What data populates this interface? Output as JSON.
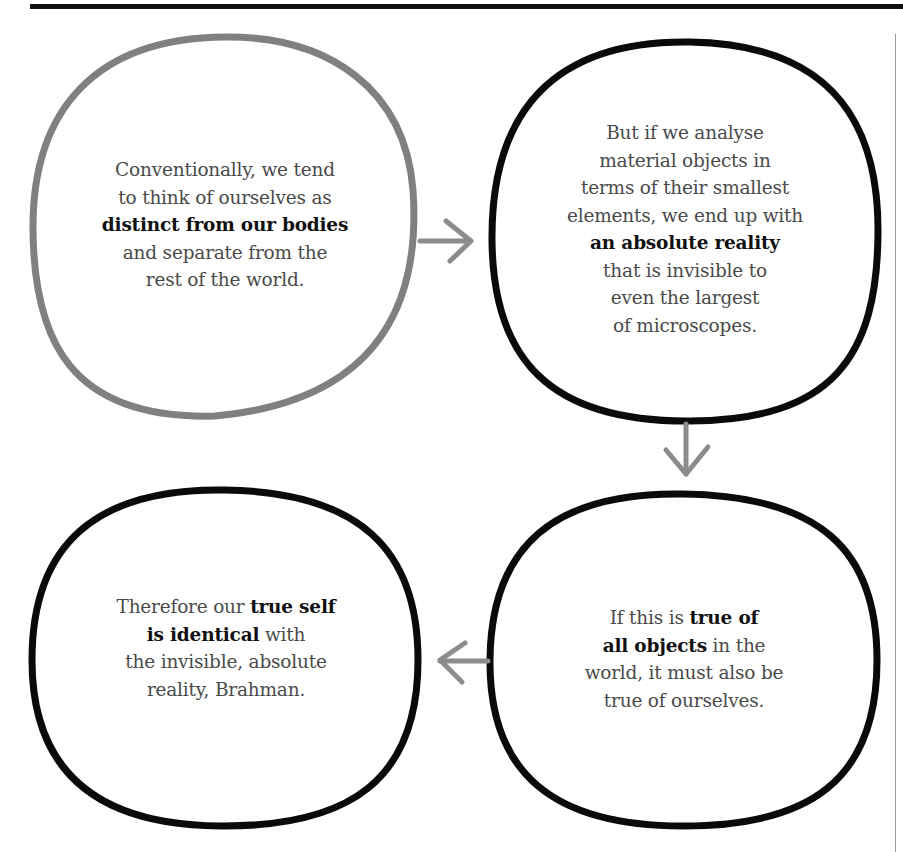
{
  "diagram": {
    "type": "cycle-flow",
    "colors": {
      "first_node_stroke": "#808080",
      "node_stroke": "#0a0a0a",
      "arrow": "#8c8c8c",
      "text": "#4a4a4a",
      "bold_text": "#111111",
      "top_rule": "#111111",
      "side_rule": "#9a9a9a"
    },
    "nodes": [
      {
        "id": "node-1",
        "position": "top-left",
        "lines": [
          {
            "parts": [
              {
                "text": "Conventionally, we tend",
                "bold": false
              }
            ]
          },
          {
            "parts": [
              {
                "text": "to think of ourselves as",
                "bold": false
              }
            ]
          },
          {
            "parts": [
              {
                "text": "distinct from our bodies",
                "bold": true
              }
            ]
          },
          {
            "parts": [
              {
                "text": "and separate from the",
                "bold": false
              }
            ]
          },
          {
            "parts": [
              {
                "text": "rest of the world.",
                "bold": false
              }
            ]
          }
        ]
      },
      {
        "id": "node-2",
        "position": "top-right",
        "lines": [
          {
            "parts": [
              {
                "text": "But if we analyse",
                "bold": false
              }
            ]
          },
          {
            "parts": [
              {
                "text": "material objects in",
                "bold": false
              }
            ]
          },
          {
            "parts": [
              {
                "text": "terms of their smallest",
                "bold": false
              }
            ]
          },
          {
            "parts": [
              {
                "text": "elements, we end up with",
                "bold": false
              }
            ]
          },
          {
            "parts": [
              {
                "text": "an absolute reality",
                "bold": true
              }
            ]
          },
          {
            "parts": [
              {
                "text": "that is invisible to",
                "bold": false
              }
            ]
          },
          {
            "parts": [
              {
                "text": "even the largest",
                "bold": false
              }
            ]
          },
          {
            "parts": [
              {
                "text": "of microscopes.",
                "bold": false
              }
            ]
          }
        ]
      },
      {
        "id": "node-3",
        "position": "bottom-right",
        "lines": [
          {
            "parts": [
              {
                "text": "If this is ",
                "bold": false
              },
              {
                "text": "true of",
                "bold": true
              }
            ]
          },
          {
            "parts": [
              {
                "text": "all objects",
                "bold": true
              },
              {
                "text": " in the",
                "bold": false
              }
            ]
          },
          {
            "parts": [
              {
                "text": "world, it must also be",
                "bold": false
              }
            ]
          },
          {
            "parts": [
              {
                "text": "true of ourselves.",
                "bold": false
              }
            ]
          }
        ]
      },
      {
        "id": "node-4",
        "position": "bottom-left",
        "lines": [
          {
            "parts": [
              {
                "text": "Therefore our ",
                "bold": false
              },
              {
                "text": "true self",
                "bold": true
              }
            ]
          },
          {
            "parts": [
              {
                "text": "is identical",
                "bold": true
              },
              {
                "text": " with",
                "bold": false
              }
            ]
          },
          {
            "parts": [
              {
                "text": "the invisible, absolute",
                "bold": false
              }
            ]
          },
          {
            "parts": [
              {
                "text": "reality, Brahman.",
                "bold": false
              }
            ]
          }
        ]
      }
    ],
    "arrows": [
      {
        "from": "node-1",
        "to": "node-2",
        "direction": "right",
        "icon": "arrow-right-icon"
      },
      {
        "from": "node-2",
        "to": "node-3",
        "direction": "down",
        "icon": "arrow-down-icon"
      },
      {
        "from": "node-3",
        "to": "node-4",
        "direction": "left",
        "icon": "arrow-left-icon"
      }
    ]
  }
}
